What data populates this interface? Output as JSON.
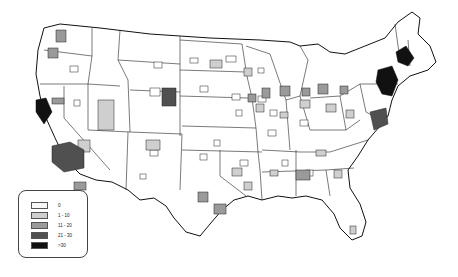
{
  "map": {
    "type": "choropleth",
    "region": "United States (contiguous)",
    "palette": {
      "c0": "#f7f7f7",
      "c1": "#bdbdbd",
      "c2": "#8f8f8f",
      "c3": "#555555",
      "c4": "#111111"
    },
    "highlights": [
      {
        "area": "San Francisco Bay area",
        "class": ">30"
      },
      {
        "area": "Southern California (Los Angeles)",
        "class": "21 - 30"
      },
      {
        "area": "Denver, Colorado",
        "class": "21 - 30"
      },
      {
        "area": "Boston / Massachusetts",
        "class": ">30"
      },
      {
        "area": "New York / New Jersey corridor",
        "class": ">30"
      },
      {
        "area": "Washington DC / Baltimore",
        "class": "21 - 30"
      },
      {
        "area": "Seattle",
        "class": "11 - 20"
      },
      {
        "area": "Houston",
        "class": "11 - 20"
      },
      {
        "area": "Atlanta",
        "class": "11 - 20"
      },
      {
        "area": "Chicago",
        "class": "11 - 20"
      },
      {
        "area": "Miami",
        "class": "1 - 10"
      }
    ]
  },
  "legend": {
    "items": [
      {
        "label": "0",
        "color": "#f7f7f7"
      },
      {
        "label": "1 - 10",
        "color": "#cfcfcf"
      },
      {
        "label": "11 - 20",
        "color": "#9a9a9a"
      },
      {
        "label": "21 - 30",
        "color": "#505050"
      },
      {
        "label": ">30",
        "color": "#111111"
      }
    ]
  }
}
